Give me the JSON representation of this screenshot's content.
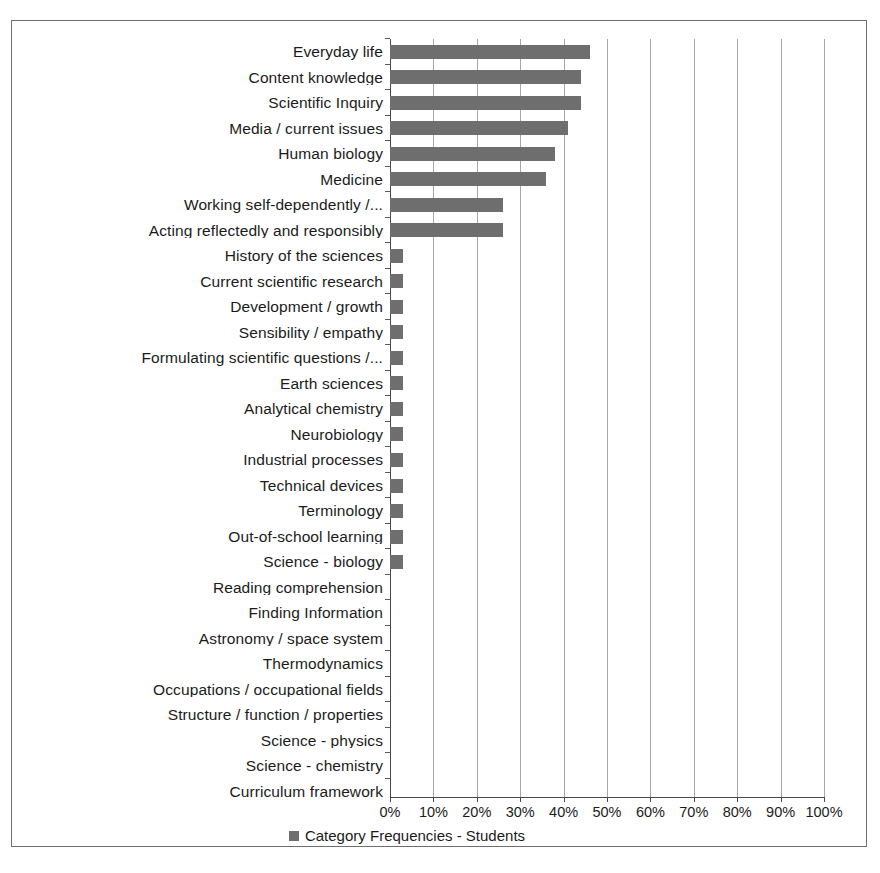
{
  "chart_data": {
    "type": "bar",
    "orientation": "horizontal",
    "title": "",
    "xlabel": "",
    "ylabel": "",
    "xlim": [
      0,
      100
    ],
    "xunit": "%",
    "grid": true,
    "legend_position": "bottom",
    "series_name": "Category Frequencies - Students",
    "bar_color": "#6e6e6e",
    "categories": [
      "Everyday life",
      "Content knowledge",
      "Scientific Inquiry",
      "Media / current issues",
      "Human biology",
      "Medicine",
      "Working self-dependently /...",
      "Acting reflectedly and responsibly",
      "History of the sciences",
      "Current scientific research",
      "Development / growth",
      "Sensibility / empathy",
      "Formulating scientific questions /...",
      "Earth sciences",
      "Analytical chemistry",
      "Neurobiology",
      "Industrial processes",
      "Technical devices",
      "Terminology",
      "Out-of-school learning",
      "Science - biology",
      "Reading comprehension",
      "Finding Information",
      "Astronomy / space system",
      "Thermodynamics",
      "Occupations / occupational fields",
      "Structure / function / properties",
      "Science - physics",
      "Science - chemistry",
      "Curriculum framework"
    ],
    "values": [
      46,
      44,
      44,
      41,
      38,
      36,
      26,
      26,
      3,
      3,
      3,
      3,
      3,
      3,
      3,
      3,
      3,
      3,
      3,
      3,
      3,
      0,
      0,
      0,
      0,
      0,
      0,
      0,
      0,
      0
    ],
    "xticks": [
      0,
      10,
      20,
      30,
      40,
      50,
      60,
      70,
      80,
      90,
      100
    ],
    "xtick_labels": [
      "0%",
      "10%",
      "20%",
      "30%",
      "40%",
      "50%",
      "60%",
      "70%",
      "80%",
      "90%",
      "100%"
    ]
  },
  "legend": {
    "label": "Category Frequencies - Students",
    "swatch_color": "#6e6e6e"
  },
  "caption": {
    "text": ""
  }
}
